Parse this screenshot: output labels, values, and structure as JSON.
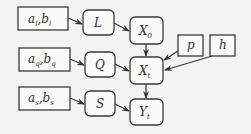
{
  "diagram": {
    "nodes": [
      {
        "id": "ab_l",
        "label": "a",
        "sub": "l",
        "label2": "b",
        "sub2": "l",
        "shape": "rect"
      },
      {
        "id": "ab_q",
        "label": "a",
        "sub": "q",
        "label2": "b",
        "sub2": "q",
        "shape": "rect"
      },
      {
        "id": "ab_s",
        "label": "a",
        "sub": "s",
        "label2": "b",
        "sub2": "s",
        "shape": "rect"
      },
      {
        "id": "L",
        "label": "L",
        "shape": "rounded"
      },
      {
        "id": "Q",
        "label": "Q",
        "shape": "rounded"
      },
      {
        "id": "S",
        "label": "S",
        "shape": "rounded"
      },
      {
        "id": "X0",
        "label": "X",
        "sub": "0",
        "shape": "rounded"
      },
      {
        "id": "Xt",
        "label": "X",
        "sub": "t",
        "shape": "rounded"
      },
      {
        "id": "Yt",
        "label": "Y",
        "sub": "t",
        "shape": "rounded"
      },
      {
        "id": "p",
        "label": "p",
        "shape": "rect"
      },
      {
        "id": "h",
        "label": "h",
        "shape": "rect"
      }
    ],
    "edges": [
      {
        "from": "ab_l",
        "to": "L"
      },
      {
        "from": "L",
        "to": "X0"
      },
      {
        "from": "ab_q",
        "to": "Q"
      },
      {
        "from": "Q",
        "to": "Xt"
      },
      {
        "from": "ab_s",
        "to": "S"
      },
      {
        "from": "S",
        "to": "Yt"
      },
      {
        "from": "X0",
        "to": "Xt"
      },
      {
        "from": "p",
        "to": "Xt"
      },
      {
        "from": "h",
        "to": "Xt"
      },
      {
        "from": "Xt",
        "to": "Yt"
      }
    ],
    "colors": {
      "background": "#f3f3f1",
      "stroke": "#3a3a3a",
      "text": "#333333"
    }
  }
}
